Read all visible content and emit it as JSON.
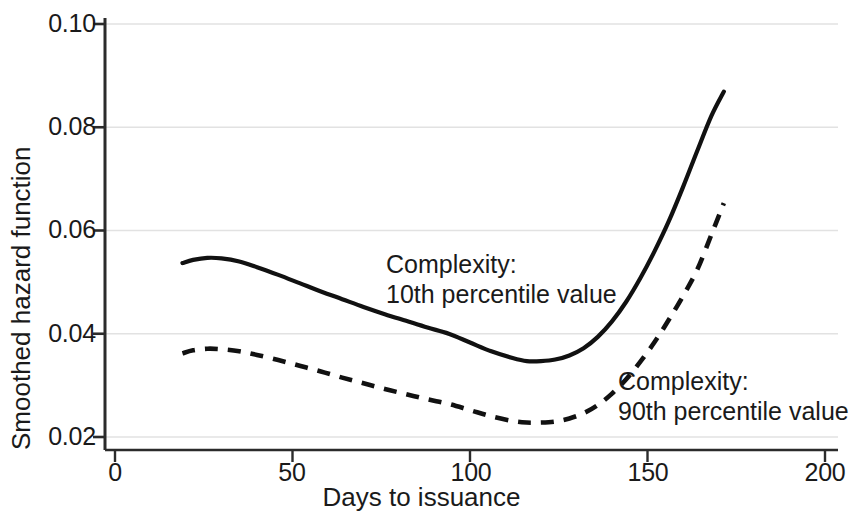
{
  "chart_data": {
    "type": "line",
    "title": "",
    "xlabel": "Days to issuance",
    "ylabel": "Smoothed hazard function",
    "xlim": [
      0,
      200
    ],
    "ylim": [
      0.02,
      0.1
    ],
    "xticks": [
      "0",
      "50",
      "100",
      "150",
      "200"
    ],
    "xtick_values": [
      0,
      50,
      100,
      150,
      200
    ],
    "yticks": [
      "0.02",
      "0.04",
      "0.06",
      "0.08",
      "0.10"
    ],
    "ytick_values": [
      0.02,
      0.04,
      0.06,
      0.08,
      0.1
    ],
    "grid": "horizontal",
    "legend": "inline-annotations",
    "series": [
      {
        "name": "Complexity: 10th percentile value",
        "style": "solid",
        "color": "#111111",
        "x": [
          19,
          22,
          26,
          30,
          35,
          40,
          46,
          52,
          58,
          64,
          70,
          76,
          82,
          88,
          94,
          100,
          106,
          112,
          116,
          120,
          124,
          128,
          132,
          136,
          140,
          144,
          148,
          152,
          156,
          160,
          164,
          168,
          171.5
        ],
        "y": [
          0.0537,
          0.0543,
          0.0547,
          0.0546,
          0.054,
          0.0529,
          0.0514,
          0.0498,
          0.0482,
          0.0467,
          0.0452,
          0.0438,
          0.0425,
          0.0412,
          0.04,
          0.0383,
          0.0366,
          0.0353,
          0.0347,
          0.0347,
          0.035,
          0.0358,
          0.0372,
          0.0394,
          0.0424,
          0.0462,
          0.0508,
          0.056,
          0.0618,
          0.0684,
          0.0754,
          0.0822,
          0.0869
        ]
      },
      {
        "name": "Complexity: 90th percentile value",
        "style": "dashed",
        "color": "#111111",
        "x": [
          19,
          22,
          26,
          30,
          35,
          40,
          46,
          52,
          58,
          64,
          70,
          76,
          82,
          88,
          94,
          100,
          106,
          112,
          116,
          120,
          124,
          128,
          132,
          136,
          140,
          144,
          148,
          152,
          156,
          160,
          164,
          168,
          171.5
        ],
        "y": [
          0.0362,
          0.0368,
          0.0371,
          0.037,
          0.0366,
          0.0359,
          0.0349,
          0.0338,
          0.0327,
          0.0315,
          0.0304,
          0.0293,
          0.0283,
          0.0273,
          0.0264,
          0.0252,
          0.024,
          0.0231,
          0.0228,
          0.0228,
          0.023,
          0.0236,
          0.0246,
          0.0262,
          0.0284,
          0.0312,
          0.0346,
          0.0384,
          0.0427,
          0.0473,
          0.0524,
          0.0592,
          0.0653
        ]
      }
    ],
    "annotations": [
      {
        "id": "annotation-10th",
        "line1": "Complexity:",
        "line2": "10th percentile value"
      },
      {
        "id": "annotation-90th",
        "line1": "Complexity:",
        "line2": "90th percentile value"
      }
    ]
  },
  "axis": {
    "y_title": "Smoothed hazard function",
    "x_title": "Days to issuance",
    "y_labels": {
      "t0": "0.10",
      "t1": "0.08",
      "t2": "0.06",
      "t3": "0.04",
      "t4": "0.02"
    },
    "x_labels": {
      "t0": "0",
      "t1": "50",
      "t2": "100",
      "t3": "150",
      "t4": "200"
    }
  },
  "annotations": {
    "a1_line1": "Complexity:",
    "a1_line2": "10th percentile value",
    "a2_line1": "Complexity:",
    "a2_line2": "90th percentile value"
  },
  "colors": {
    "axis": "#2b2b2b",
    "grid": "#e2e2e2",
    "curve": "#111111",
    "text": "#1a1a1a"
  }
}
